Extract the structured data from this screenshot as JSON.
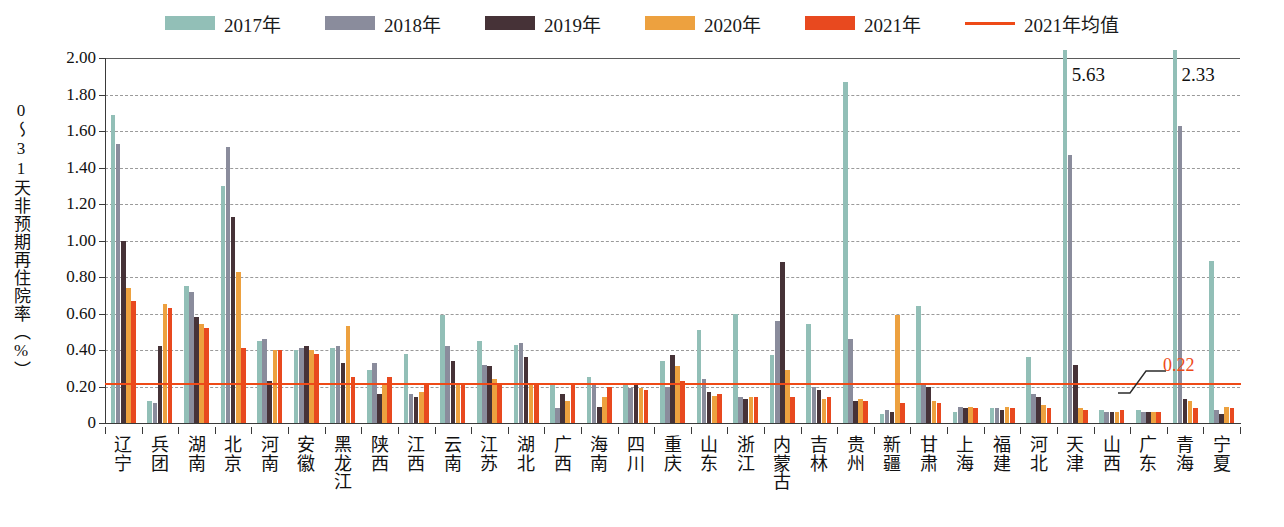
{
  "legend": {
    "items": [
      {
        "label": "2017年",
        "color": "#92bfb7",
        "type": "swatch",
        "name": "legend-2017"
      },
      {
        "label": "2018年",
        "color": "#8a8c9c",
        "type": "swatch",
        "name": "legend-2018"
      },
      {
        "label": "2019年",
        "color": "#463237",
        "type": "swatch",
        "name": "legend-2019"
      },
      {
        "label": "2020年",
        "color": "#eda13f",
        "type": "swatch",
        "name": "legend-2020"
      },
      {
        "label": "2021年",
        "color": "#e8491f",
        "type": "swatch",
        "name": "legend-2021"
      },
      {
        "label": "2021年均值",
        "color": "#ee4a17",
        "type": "line",
        "name": "legend-2021-mean"
      }
    ]
  },
  "axes": {
    "ylabel": "0～31天非预期再住院率（%）",
    "yticks": [
      "2.00",
      "1.80",
      "1.60",
      "1.40",
      "1.20",
      "1.00",
      "0.80",
      "0.60",
      "0.40",
      "0.20",
      "0"
    ],
    "ylim": [
      0,
      2.0
    ],
    "xlabel": ""
  },
  "average": {
    "value": 0.22,
    "label": "0.22",
    "color": "#ee4a17"
  },
  "clipped_annotations": [
    {
      "category": "天津",
      "series": "2017年",
      "label": "5.63",
      "value": 5.63
    },
    {
      "category": "青海",
      "series": "2017年",
      "label": "2.33",
      "value": 2.33
    }
  ],
  "chart_data": {
    "type": "bar",
    "title": "",
    "subtitle": "",
    "xlabel": "",
    "ylabel": "0～31天非预期再住院率（%）",
    "ylim": [
      0,
      2.0
    ],
    "ytick_step": 0.2,
    "grid": true,
    "legend_position": "top",
    "annotations": [
      {
        "text": "5.63",
        "category": "天津",
        "series": "2017年",
        "note": "bar exceeds axis maximum, value labeled"
      },
      {
        "text": "2.33",
        "category": "青海",
        "series": "2017年",
        "note": "bar exceeds axis maximum, value labeled"
      },
      {
        "text": "0.22",
        "series": "2021年均值",
        "note": "horizontal reference line for 2021 national mean"
      }
    ],
    "categories": [
      "辽宁",
      "兵团",
      "湖南",
      "北京",
      "河南",
      "安徽",
      "黑龙江",
      "陕西",
      "江西",
      "云南",
      "江苏",
      "湖北",
      "广西",
      "海南",
      "四川",
      "重庆",
      "山东",
      "浙江",
      "内蒙古",
      "吉林",
      "贵州",
      "新疆",
      "甘肃",
      "上海",
      "福建",
      "河北",
      "天津",
      "山西",
      "广东",
      "青海",
      "宁夏"
    ],
    "series": [
      {
        "name": "2017年",
        "color": "#92bfb7",
        "values": [
          1.69,
          0.12,
          0.75,
          1.3,
          0.45,
          0.4,
          0.41,
          0.29,
          0.38,
          0.59,
          0.45,
          0.43,
          0.21,
          0.25,
          0.21,
          0.34,
          0.51,
          0.6,
          0.37,
          0.54,
          1.87,
          0.05,
          0.64,
          0.06,
          0.08,
          0.36,
          5.63,
          0.07,
          0.07,
          2.33,
          0.89
        ]
      },
      {
        "name": "2018年",
        "color": "#8a8c9c",
        "values": [
          1.53,
          0.11,
          0.72,
          1.51,
          0.46,
          0.41,
          0.42,
          0.33,
          0.16,
          0.42,
          0.32,
          0.44,
          0.08,
          0.21,
          0.19,
          0.2,
          0.24,
          0.14,
          0.56,
          0.2,
          0.46,
          0.07,
          0.21,
          0.09,
          0.08,
          0.16,
          1.47,
          0.06,
          0.06,
          1.63,
          0.07
        ]
      },
      {
        "name": "2019年",
        "color": "#463237",
        "values": [
          1.0,
          0.42,
          0.58,
          1.13,
          0.23,
          0.42,
          0.33,
          0.16,
          0.14,
          0.34,
          0.31,
          0.36,
          0.16,
          0.09,
          0.22,
          0.37,
          0.17,
          0.13,
          0.88,
          0.18,
          0.12,
          0.06,
          0.2,
          0.08,
          0.07,
          0.14,
          0.32,
          0.06,
          0.06,
          0.13,
          0.05
        ]
      },
      {
        "name": "2020年",
        "color": "#eda13f",
        "values": [
          0.74,
          0.65,
          0.54,
          0.83,
          0.4,
          0.4,
          0.53,
          0.21,
          0.17,
          0.22,
          0.24,
          0.21,
          0.12,
          0.14,
          0.19,
          0.31,
          0.15,
          0.14,
          0.29,
          0.13,
          0.13,
          0.59,
          0.12,
          0.09,
          0.09,
          0.1,
          0.08,
          0.06,
          0.06,
          0.12,
          0.09
        ]
      },
      {
        "name": "2021年",
        "color": "#e8491f",
        "values": [
          0.67,
          0.63,
          0.52,
          0.41,
          0.4,
          0.38,
          0.25,
          0.25,
          0.22,
          0.22,
          0.21,
          0.21,
          0.21,
          0.2,
          0.18,
          0.23,
          0.16,
          0.14,
          0.14,
          0.14,
          0.12,
          0.11,
          0.11,
          0.08,
          0.08,
          0.08,
          0.07,
          0.07,
          0.06,
          0.08,
          0.08
        ]
      }
    ],
    "reference_line": {
      "name": "2021年均值",
      "value": 0.22,
      "label": "0.22",
      "color": "#ee4a17"
    }
  }
}
